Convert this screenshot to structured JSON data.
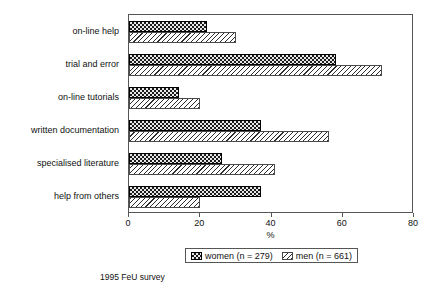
{
  "chart_data": {
    "type": "bar",
    "orientation": "horizontal",
    "title": "",
    "xlabel": "%",
    "ylabel": "",
    "xlim": [
      0,
      80
    ],
    "xticks": [
      0,
      20,
      40,
      60,
      80
    ],
    "xtick_labels": [
      "0",
      "20",
      "40",
      "60",
      "80"
    ],
    "grid": false,
    "legend_position": "bottom-center",
    "categories": [
      "on-line help",
      "trial and error",
      "on-line tutorials",
      "written documentation",
      "specialised literature",
      "help from others"
    ],
    "series": [
      {
        "name": "women (n = 279)",
        "short_name": "women",
        "n": 279,
        "fill": "dark-checkered",
        "values": [
          22,
          58,
          14,
          37,
          26,
          37
        ]
      },
      {
        "name": "men (n = 661)",
        "short_name": "men",
        "n": 661,
        "fill": "diagonal-hatch",
        "values": [
          30,
          71,
          20,
          56,
          41,
          20
        ]
      }
    ]
  },
  "legend": {
    "entries": [
      {
        "label": "women (n = 279)",
        "swatch": "dark-checkered-swatch"
      },
      {
        "label": "men (n = 661)",
        "swatch": "diagonal-hatch-swatch"
      }
    ]
  },
  "axis": {
    "x_title": "%",
    "tick_labels": [
      "0",
      "20",
      "40",
      "60",
      "80"
    ]
  },
  "caption": "1995 FeU survey",
  "colors": {
    "women_fill": "#1b1b1b",
    "men_fill": "#ffffff",
    "hatch_line": "#2e2e2e",
    "frame": "#555555",
    "text": "#111111",
    "background": "#ffffff"
  }
}
